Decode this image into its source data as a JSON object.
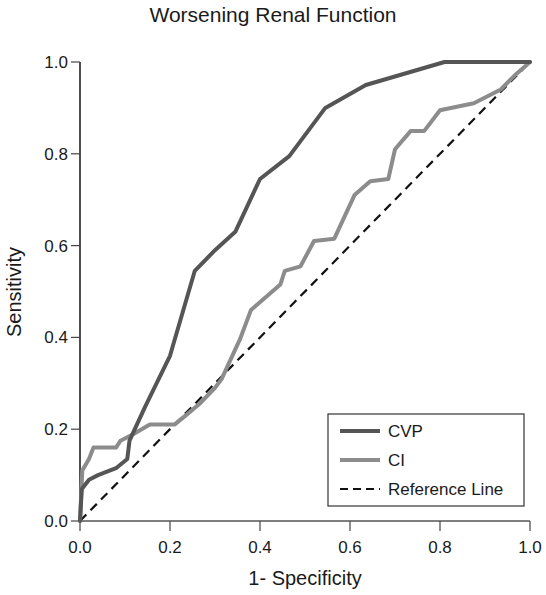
{
  "chart_data": {
    "type": "line",
    "title": "Worsening Renal Function",
    "xlabel": "1- Specificity",
    "ylabel": "Sensitivity",
    "xlim": [
      0,
      1.0
    ],
    "ylim": [
      0,
      1.0
    ],
    "xticks": [
      "0.0",
      "0.2",
      "0.4",
      "0.6",
      "0.8",
      "1.0"
    ],
    "yticks": [
      "0.0",
      "0.2",
      "0.4",
      "0.6",
      "0.8",
      "1.0"
    ],
    "grid": false,
    "legend_position": "lower right",
    "series": [
      {
        "name": "CVP",
        "color": "#555555",
        "style": "solid",
        "x": [
          0,
          0.004,
          0.02,
          0.04,
          0.08,
          0.105,
          0.11,
          0.145,
          0.2,
          0.255,
          0.3,
          0.345,
          0.4,
          0.465,
          0.545,
          0.635,
          0.81,
          1.0
        ],
        "y": [
          0,
          0.07,
          0.09,
          0.1,
          0.115,
          0.135,
          0.175,
          0.25,
          0.36,
          0.545,
          0.59,
          0.63,
          0.745,
          0.795,
          0.9,
          0.95,
          1.0,
          1.0
        ]
      },
      {
        "name": "CI",
        "color": "#8c8c8c",
        "style": "solid",
        "x": [
          0,
          0.005,
          0.02,
          0.03,
          0.08,
          0.09,
          0.12,
          0.155,
          0.21,
          0.235,
          0.265,
          0.3,
          0.315,
          0.355,
          0.38,
          0.445,
          0.455,
          0.49,
          0.52,
          0.565,
          0.61,
          0.645,
          0.685,
          0.7,
          0.735,
          0.765,
          0.8,
          0.875,
          0.935,
          0.965,
          1.0
        ],
        "y": [
          0,
          0.11,
          0.135,
          0.16,
          0.16,
          0.175,
          0.19,
          0.21,
          0.21,
          0.23,
          0.255,
          0.29,
          0.31,
          0.395,
          0.46,
          0.515,
          0.545,
          0.555,
          0.61,
          0.615,
          0.71,
          0.74,
          0.745,
          0.81,
          0.85,
          0.85,
          0.895,
          0.91,
          0.94,
          0.97,
          1.0
        ]
      },
      {
        "name": "Reference Line",
        "color": "#111111",
        "style": "dashed",
        "x": [
          0,
          1.0
        ],
        "y": [
          0,
          1.0
        ]
      }
    ]
  },
  "legend": {
    "items": [
      {
        "label": "CVP"
      },
      {
        "label": "CI"
      },
      {
        "label": "Reference Line"
      }
    ]
  }
}
